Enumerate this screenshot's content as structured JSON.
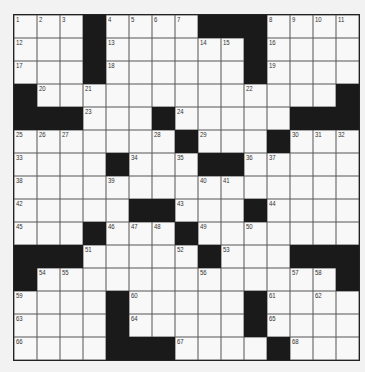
{
  "puzzle": {
    "rows": 15,
    "cols": 15,
    "colors": {
      "black": "#1a1a1a",
      "white": "#f8f8f8",
      "line": "#555555"
    },
    "grid": [
      [
        "1",
        "2",
        "3",
        "#",
        "4",
        "5",
        "6",
        "7",
        "#",
        "#",
        "#",
        "8",
        "9",
        "10",
        "11"
      ],
      [
        "12",
        ".",
        ".",
        "#",
        "13",
        ".",
        ".",
        ".",
        "14",
        "15",
        "#",
        "16",
        ".",
        ".",
        "."
      ],
      [
        "17",
        ".",
        ".",
        "#",
        "18",
        ".",
        ".",
        ".",
        ".",
        ".",
        "#",
        "19",
        ".",
        ".",
        "."
      ],
      [
        "#",
        "20",
        ".",
        "21",
        ".",
        ".",
        ".",
        ".",
        ".",
        ".",
        "22",
        ".",
        ".",
        ".",
        "#"
      ],
      [
        "#",
        "#",
        "#",
        "23",
        ".",
        ".",
        "#",
        "24",
        ".",
        ".",
        ".",
        ".",
        "#",
        "#",
        "#"
      ],
      [
        "25",
        "26",
        "27",
        ".",
        ".",
        ".",
        "28",
        "#",
        "29",
        ".",
        ".",
        "#",
        "30",
        "31",
        "32"
      ],
      [
        "33",
        ".",
        ".",
        ".",
        "#",
        "34",
        ".",
        "35",
        "#",
        "#",
        "36",
        "37",
        ".",
        ".",
        "."
      ],
      [
        "38",
        ".",
        ".",
        ".",
        "39",
        ".",
        ".",
        ".",
        "40",
        "41",
        ".",
        ".",
        ".",
        ".",
        "."
      ],
      [
        "42",
        ".",
        ".",
        ".",
        ".",
        "#",
        "#",
        "43",
        ".",
        ".",
        "#",
        "44",
        ".",
        ".",
        "."
      ],
      [
        "45",
        ".",
        ".",
        "#",
        "46",
        "47",
        "48",
        "#",
        "49",
        ".",
        "50",
        ".",
        ".",
        ".",
        "."
      ],
      [
        "#",
        "#",
        "#",
        "51",
        ".",
        ".",
        ".",
        "52",
        "#",
        "53",
        ".",
        ".",
        "#",
        "#",
        "#"
      ],
      [
        "#",
        "54",
        "55",
        ".",
        ".",
        ".",
        ".",
        ".",
        "56",
        ".",
        ".",
        ".",
        "57",
        "58",
        "#"
      ],
      [
        "59",
        ".",
        ".",
        ".",
        "#",
        "60",
        ".",
        ".",
        ".",
        ".",
        "#",
        "61",
        ".",
        "62",
        "."
      ],
      [
        "63",
        ".",
        ".",
        ".",
        "#",
        "64",
        ".",
        ".",
        ".",
        ".",
        "#",
        "65",
        ".",
        ".",
        "."
      ],
      [
        "66",
        ".",
        ".",
        ".",
        "#",
        "#",
        "#",
        "67",
        ".",
        ".",
        ".",
        "#",
        "68",
        ".",
        "."
      ]
    ]
  }
}
